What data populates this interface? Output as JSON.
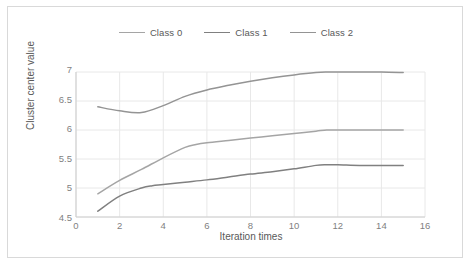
{
  "chart_data": {
    "type": "line",
    "title": "",
    "xlabel": "Iteration times",
    "ylabel": "Cluster center value",
    "xlim": [
      0,
      16
    ],
    "ylim": [
      4.5,
      7
    ],
    "xticks": [
      "0",
      "2",
      "4",
      "6",
      "8",
      "10",
      "12",
      "14",
      "16"
    ],
    "yticks": [
      "4.5",
      "5",
      "5.5",
      "6",
      "6.5",
      "7"
    ],
    "grid": true,
    "legend_position": "top-center",
    "series": [
      {
        "name": "Class 0",
        "color": "#a5a5a5",
        "x": [
          1,
          2,
          3,
          4,
          5,
          5.5,
          6,
          7,
          8,
          9,
          10,
          11,
          11.5,
          12,
          13,
          14,
          15
        ],
        "values": [
          4.9,
          5.13,
          5.32,
          5.52,
          5.7,
          5.75,
          5.78,
          5.82,
          5.86,
          5.9,
          5.94,
          5.98,
          6.0,
          6.0,
          6.0,
          6.0,
          6.0
        ]
      },
      {
        "name": "Class 1",
        "color": "#808080",
        "x": [
          1,
          2,
          3,
          3.5,
          4,
          5,
          6,
          7,
          8,
          9,
          10,
          11,
          11.5,
          12,
          13,
          14,
          15
        ],
        "values": [
          4.6,
          4.86,
          5.0,
          5.04,
          5.06,
          5.1,
          5.14,
          5.19,
          5.24,
          5.28,
          5.33,
          5.39,
          5.4,
          5.4,
          5.39,
          5.39,
          5.39
        ]
      },
      {
        "name": "Class 2",
        "color": "#949494",
        "x": [
          1,
          2,
          3,
          4,
          5,
          6,
          7,
          8,
          9,
          10,
          11,
          11.5,
          12,
          13,
          14,
          15
        ],
        "values": [
          6.4,
          6.33,
          6.3,
          6.42,
          6.58,
          6.69,
          6.77,
          6.84,
          6.9,
          6.95,
          6.99,
          7.0,
          7.0,
          7.0,
          7.0,
          6.99
        ]
      }
    ]
  },
  "legend": {
    "items": [
      {
        "label": "Class 0"
      },
      {
        "label": "Class 1"
      },
      {
        "label": "Class 2"
      }
    ]
  },
  "axes": {
    "x_title": "Iteration times",
    "y_title": "Cluster center value",
    "x_ticks": [
      "0",
      "2",
      "4",
      "6",
      "8",
      "10",
      "12",
      "14",
      "16"
    ],
    "y_ticks": [
      "7",
      "6.5",
      "6",
      "5.5",
      "5",
      "4.5"
    ]
  },
  "colors": {
    "grid": "#e8e8e8",
    "axis": "#d0d0d0",
    "text": "#7f7f7f",
    "title_text": "#595959",
    "frame": "#d9d9d9",
    "series_0": "#a5a5a5",
    "series_1": "#808080",
    "series_2": "#949494"
  }
}
